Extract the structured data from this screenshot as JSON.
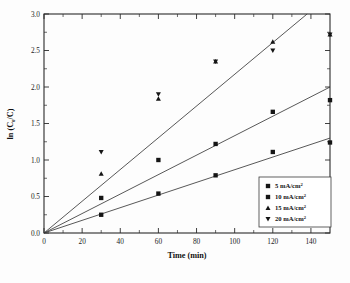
{
  "chart_data": {
    "type": "scatter",
    "title": "",
    "xlabel": "Time (min)",
    "ylabel": "ln (C0/C)",
    "ylabel_parts": {
      "pre": "ln (C",
      "sub": "0",
      "mid": "/C)"
    },
    "xlim": [
      0,
      150
    ],
    "ylim": [
      0.0,
      3.0
    ],
    "xticks": [
      0,
      20,
      40,
      60,
      80,
      100,
      120,
      140
    ],
    "xticklabels": [
      "0",
      "20",
      "40",
      "60",
      "80",
      "100",
      "120",
      "140"
    ],
    "yticks": [
      0.0,
      0.5,
      1.0,
      1.5,
      2.0,
      2.5,
      3.0
    ],
    "yticklabels": [
      "0.0",
      "0.5",
      "1.0",
      "1.5",
      "2.0",
      "2.5",
      "3.0"
    ],
    "xminor_step": 10,
    "yminor_step": 0.25,
    "grid": false,
    "legend_position": "lower-right",
    "x": [
      30,
      60,
      90,
      120,
      150
    ],
    "series": [
      {
        "name": "5 mA/cm2",
        "label_value": "5",
        "label_unit": "mA/cm",
        "label_exp": "2",
        "marker": "square",
        "values": [
          0.25,
          0.54,
          0.79,
          1.11,
          1.24
        ]
      },
      {
        "name": "10 mA/cm2",
        "label_value": "10",
        "label_unit": "mA/cm",
        "label_exp": "2",
        "marker": "square",
        "values": [
          0.48,
          1.0,
          1.22,
          1.66,
          1.82
        ]
      },
      {
        "name": "15 mA/cm2",
        "label_value": "15",
        "label_unit": "mA/cm",
        "label_exp": "2",
        "marker": "triangle-up",
        "values": [
          0.81,
          1.84,
          2.35,
          2.62,
          2.72
        ]
      },
      {
        "name": "20 mA/cm2",
        "label_value": "20",
        "label_unit": "mA/cm",
        "label_exp": "2",
        "marker": "triangle-down",
        "values": [
          1.11,
          1.9,
          2.35,
          2.5,
          2.72
        ]
      }
    ],
    "fit_lines": [
      {
        "name": "fit-high",
        "slope": 0.02174,
        "intercept": 0.0,
        "x_end": 138.0
      },
      {
        "name": "fit-mid",
        "slope": 0.01333,
        "intercept": 0.0,
        "x_end": 150.0
      },
      {
        "name": "fit-low",
        "slope": 0.00867,
        "intercept": 0.0,
        "x_end": 150.0
      }
    ]
  },
  "legend": {
    "entries": [
      {
        "marker": "square",
        "value": "5",
        "unit": "mA/cm",
        "exp": "2"
      },
      {
        "marker": "square",
        "value": "10",
        "unit": "mA/cm",
        "exp": "2"
      },
      {
        "marker": "triangle-up",
        "value": "15",
        "unit": "mA/cm",
        "exp": "2"
      },
      {
        "marker": "triangle-down",
        "value": "20",
        "unit": "mA/cm",
        "exp": "2"
      }
    ]
  },
  "colors": {
    "axis": "#2b2b2b",
    "marker": "#151515",
    "line": "#3a3a3a",
    "background": "#fdfdfd"
  }
}
